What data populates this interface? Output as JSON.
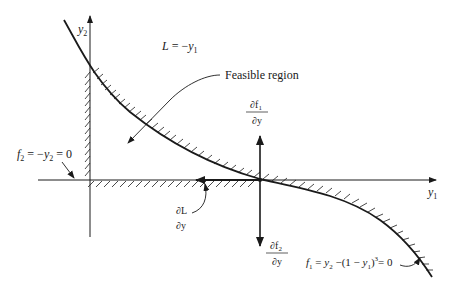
{
  "diagram": {
    "axes": {
      "y1_label": "y",
      "y1_sub": "1",
      "y2_label": "y",
      "y2_sub": "2"
    },
    "objective": {
      "text_L": "L",
      "text_eq": " = −",
      "text_y": "y",
      "text_sub": "1"
    },
    "feasible_region_label": "Feasible region",
    "constraint_f2": {
      "f": "f",
      "f_sub": "2",
      "eq": " = −",
      "y": "y",
      "y_sub": "2",
      "tail": " = 0"
    },
    "constraint_f1": {
      "f": "f",
      "f_sub": "1",
      "eq1": " = ",
      "y2": "y",
      "y2_sub": "2",
      "mid": " −(1 − ",
      "y1": "y",
      "y1_sub": "1",
      "close": ")",
      "sup": "3",
      "tail": "= 0"
    },
    "gradient_f1": {
      "num": "∂f",
      "num_sub": "1",
      "den": "∂y"
    },
    "gradient_f2": {
      "num": "∂f",
      "num_sub": "2",
      "den": "∂y"
    },
    "gradient_L": {
      "num": "∂L",
      "den": "∂y"
    },
    "colors": {
      "ink": "#1a1a1a",
      "background": "#ffffff"
    }
  }
}
